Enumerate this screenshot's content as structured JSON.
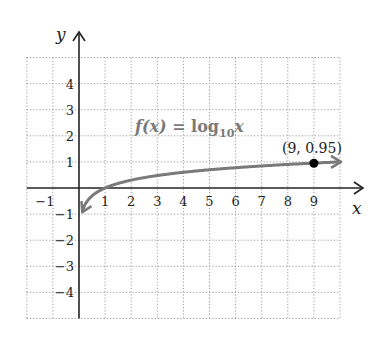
{
  "chart_data": {
    "type": "line",
    "function_label": {
      "prefix": "f(x) = log",
      "subscript": "10",
      "variable": "x"
    },
    "xlabel": "x",
    "ylabel": "y",
    "xlim": [
      -2,
      10
    ],
    "ylim": [
      -5,
      5
    ],
    "grid": true,
    "grid_style": "dotted",
    "x_ticks": [
      "-1",
      "1",
      "2",
      "3",
      "4",
      "5",
      "6",
      "7",
      "8",
      "9"
    ],
    "y_ticks": [
      "4",
      "3",
      "2",
      "1",
      "-1",
      "-2",
      "-3",
      "-4"
    ],
    "series": [
      {
        "name": "f(x) = log10 x",
        "color": "#7a7a7a",
        "x": [
          0.126,
          0.2,
          0.3,
          0.5,
          1,
          2,
          3,
          4,
          5,
          6,
          7,
          8,
          9,
          10
        ],
        "y": [
          -0.9,
          -0.7,
          -0.52,
          -0.3,
          0,
          0.3,
          0.48,
          0.6,
          0.7,
          0.78,
          0.85,
          0.9,
          0.95,
          1.0
        ]
      }
    ],
    "annotations": [
      {
        "label": "(9, 0.95)",
        "x": 9,
        "y": 0.95,
        "marker": "dot"
      }
    ]
  },
  "colors": {
    "axis": "#222222",
    "grid": "#9a9a9a",
    "curve": "#7a7a7a",
    "point": "#000000"
  }
}
